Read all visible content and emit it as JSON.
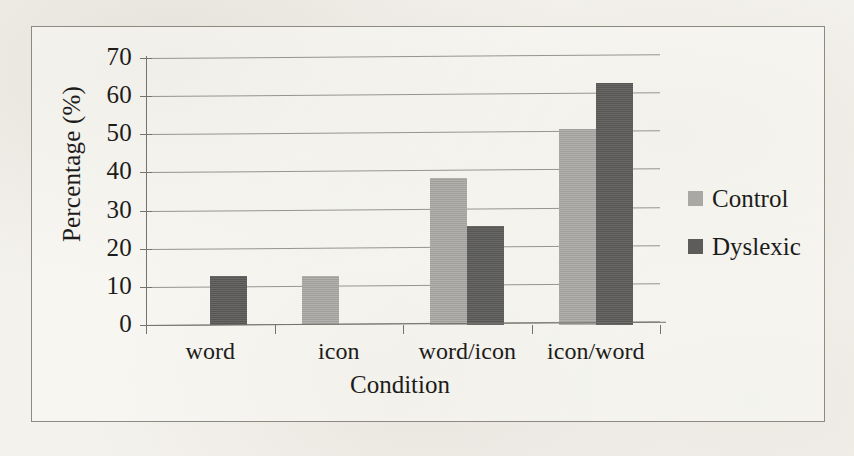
{
  "chart_data": {
    "type": "bar",
    "title": "",
    "subtitle": "",
    "xlabel": "Condition",
    "ylabel": "Percentage (%)",
    "categories": [
      "word",
      "icon",
      "word/icon",
      "icon/word"
    ],
    "series": [
      {
        "name": "Control",
        "color": "#a9a8a4",
        "values": [
          null,
          12.9,
          38.5,
          51.3
        ]
      },
      {
        "name": "Dyslexic",
        "color": "#5d5c5a",
        "values": [
          12.8,
          null,
          26.0,
          63.5
        ]
      }
    ],
    "ylim": [
      0,
      70
    ],
    "ytick_step": 10,
    "yticks": [
      70,
      60,
      50,
      40,
      30,
      20,
      10,
      0
    ],
    "ytick_labels": [
      "70",
      "60",
      "50",
      "40",
      "30",
      "20",
      "10",
      "0"
    ],
    "grid": true,
    "grid_axis": "y",
    "legend_position": "right",
    "legend_entries": [
      "Control",
      "Dyslexic"
    ],
    "annotations": []
  },
  "figure": {
    "border_color": "#8d8a84",
    "background_color": "#f4f2ec",
    "axis_color": "#76736d",
    "gridline_color": "#8f8c86",
    "text_color": "#1d1c1a"
  }
}
